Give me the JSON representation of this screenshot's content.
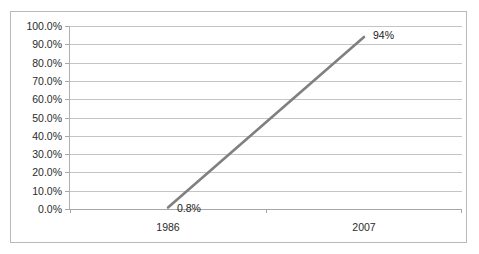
{
  "chart_data": {
    "type": "line",
    "title": "",
    "subtitle": "",
    "xlabel": "",
    "ylabel": "",
    "categories": [
      "1986",
      "2007"
    ],
    "x": [
      "1986",
      "2007"
    ],
    "series": [
      {
        "name": "",
        "values": [
          0.008,
          0.94
        ],
        "point_labels": [
          "0.8%",
          "94%"
        ],
        "color": "#808080"
      }
    ],
    "ylim": [
      0,
      1
    ],
    "ytick_values": [
      1.0,
      0.9,
      0.8,
      0.7,
      0.6,
      0.5,
      0.4,
      0.3,
      0.2,
      0.1,
      0.0
    ],
    "ytick_labels": [
      "100.0%",
      "90.0%",
      "80.0%",
      "70.0%",
      "60.0%",
      "50.0%",
      "40.0%",
      "30.0%",
      "20.0%",
      "10.0%",
      "0.0%"
    ],
    "grid": true,
    "grid_axis": "y",
    "legend": false,
    "legend_position": "none",
    "annotations": [
      {
        "text": "0.8%",
        "attached_to": "1986"
      },
      {
        "text": "94%",
        "attached_to": "2007"
      }
    ],
    "colors": {
      "series_line": "#808080",
      "gridline": "#c4c4c4",
      "axis": "#a6a6a6",
      "frame_border": "#b9b9b9",
      "background": "#ffffff",
      "text": "#2b2b2b"
    }
  }
}
